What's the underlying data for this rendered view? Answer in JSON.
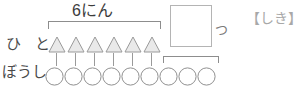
{
  "worksheet": {
    "width": 303,
    "height": 89,
    "background": "#ffffff"
  },
  "labels": {
    "row_people": "ひ と",
    "row_hats": "ぼうし",
    "group_count": "6にん",
    "unit_suffix": "つ",
    "formula_marker": "【しき】"
  },
  "answer_box": {
    "value": "",
    "placeholder": ""
  },
  "diagram": {
    "triangle_count": 6,
    "circle_count": 9,
    "connector_count": 6,
    "triangle_fill": "#e9e9e9",
    "triangle_stroke": "#9a9a9a",
    "circle_fill": "#ffffff",
    "circle_stroke": "#8f8f8f",
    "bracket_stroke": "#8d8d8d",
    "top_bracket_spans": 6,
    "bottom_bracket_spans": 3,
    "triangles": [
      {
        "index": 1
      },
      {
        "index": 2
      },
      {
        "index": 3
      },
      {
        "index": 4
      },
      {
        "index": 5
      },
      {
        "index": 6
      }
    ],
    "circles": [
      {
        "index": 1,
        "bracketed": false
      },
      {
        "index": 2,
        "bracketed": false
      },
      {
        "index": 3,
        "bracketed": false
      },
      {
        "index": 4,
        "bracketed": false
      },
      {
        "index": 5,
        "bracketed": false
      },
      {
        "index": 6,
        "bracketed": false
      },
      {
        "index": 7,
        "bracketed": true
      },
      {
        "index": 8,
        "bracketed": true
      },
      {
        "index": 9,
        "bracketed": true
      }
    ]
  }
}
